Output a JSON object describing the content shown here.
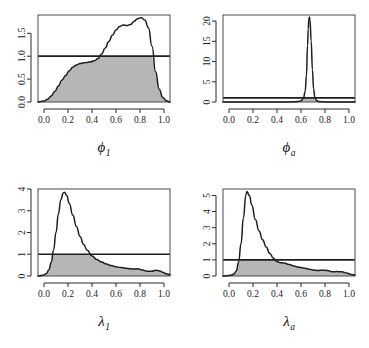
{
  "figure": {
    "title": "",
    "layout": "2x2 panel grid of kernel density plots",
    "background_color": "#ffffff",
    "curve_color": "#1d1d1d",
    "fill_color": "#b6b6b6",
    "reference_line_value": 1
  },
  "chart_data": [
    {
      "type": "line",
      "panel": "top-left",
      "title": "",
      "xlabel": "ϕ₁",
      "xlabel_base": "ϕ",
      "xlabel_sub": "1",
      "ylabel": "",
      "xlim": [
        -0.05,
        1.05
      ],
      "ylim": [
        0.0,
        1.9
      ],
      "xticks": [
        0.0,
        0.2,
        0.4,
        0.6,
        0.8,
        1.0
      ],
      "xticklabels": [
        "0.0",
        "0.2",
        "0.4",
        "0.6",
        "0.8",
        "1.0"
      ],
      "yticks": [
        0.0,
        0.5,
        1.0,
        1.5
      ],
      "yticklabels": [
        "0.0",
        "0.5",
        "1.0",
        "1.5"
      ],
      "grid": false,
      "legend": "none",
      "annotations": [
        "horizontal reference line at y = 1",
        "shaded region = min(density, 1)"
      ],
      "reference_line_y": 1.0,
      "x": [
        -0.05,
        0.0,
        0.03,
        0.06,
        0.09,
        0.12,
        0.15,
        0.18,
        0.21,
        0.24,
        0.27,
        0.3,
        0.33,
        0.36,
        0.39,
        0.42,
        0.45,
        0.48,
        0.51,
        0.54,
        0.57,
        0.6,
        0.63,
        0.66,
        0.69,
        0.72,
        0.75,
        0.78,
        0.81,
        0.84,
        0.87,
        0.9,
        0.93,
        0.96,
        0.99,
        1.02,
        1.05
      ],
      "y": [
        0.0,
        0.02,
        0.06,
        0.13,
        0.23,
        0.35,
        0.48,
        0.58,
        0.68,
        0.76,
        0.81,
        0.84,
        0.855,
        0.865,
        0.88,
        0.9,
        0.95,
        1.05,
        1.18,
        1.32,
        1.46,
        1.57,
        1.65,
        1.68,
        1.67,
        1.69,
        1.76,
        1.82,
        1.84,
        1.79,
        1.62,
        1.22,
        0.66,
        0.28,
        0.1,
        0.03,
        0.0
      ]
    },
    {
      "type": "line",
      "panel": "top-right",
      "title": "",
      "xlabel": "ϕₐ",
      "xlabel_base": "ϕ",
      "xlabel_sub": "a",
      "ylabel": "",
      "xlim": [
        -0.05,
        1.05
      ],
      "ylim": [
        0,
        21.5
      ],
      "xticks": [
        0.0,
        0.2,
        0.4,
        0.6,
        0.8,
        1.0
      ],
      "xticklabels": [
        "0.0",
        "0.2",
        "0.4",
        "0.6",
        "0.8",
        "1.0"
      ],
      "yticks": [
        0,
        5,
        10,
        15,
        20
      ],
      "yticklabels": [
        "0",
        "5",
        "10",
        "15",
        "20"
      ],
      "grid": false,
      "legend": "none",
      "annotations": [
        "horizontal reference line at y = 1",
        "sharp peak near x = 0.67 reaching 21"
      ],
      "reference_line_y": 1.0,
      "x": [
        -0.05,
        0.0,
        0.1,
        0.2,
        0.3,
        0.4,
        0.5,
        0.55,
        0.58,
        0.6,
        0.62,
        0.635,
        0.645,
        0.655,
        0.66,
        0.665,
        0.67,
        0.675,
        0.685,
        0.695,
        0.705,
        0.715,
        0.73,
        0.75,
        0.8,
        0.85,
        0.9,
        0.95,
        1.0,
        1.05
      ],
      "y": [
        0.0,
        0.0,
        0.0,
        0.0,
        0.0,
        0.0,
        0.02,
        0.06,
        0.15,
        0.3,
        0.9,
        2.6,
        6.5,
        14.0,
        18.0,
        20.4,
        21.0,
        20.2,
        15.0,
        8.0,
        3.2,
        1.2,
        0.35,
        0.1,
        0.02,
        0.0,
        0.0,
        0.0,
        0.0,
        0.0
      ]
    },
    {
      "type": "line",
      "panel": "bottom-left",
      "title": "",
      "xlabel": "λ₁",
      "xlabel_base": "λ",
      "xlabel_sub": "1",
      "ylabel": "",
      "xlim": [
        -0.05,
        1.05
      ],
      "ylim": [
        0,
        4.0
      ],
      "xticks": [
        0.0,
        0.2,
        0.4,
        0.6,
        0.8,
        1.0
      ],
      "xticklabels": [
        "0.0",
        "0.2",
        "0.4",
        "0.6",
        "0.8",
        "1.0"
      ],
      "yticks": [
        0,
        1,
        2,
        3,
        4
      ],
      "yticklabels": [
        "0",
        "1",
        "2",
        "3",
        "4"
      ],
      "grid": false,
      "legend": "none",
      "annotations": [
        "horizontal reference line at y = 1",
        "peak about 3.85 near x = 0.17"
      ],
      "reference_line_y": 1.0,
      "x": [
        -0.05,
        0.0,
        0.02,
        0.04,
        0.06,
        0.08,
        0.1,
        0.12,
        0.14,
        0.16,
        0.17,
        0.19,
        0.21,
        0.24,
        0.27,
        0.3,
        0.33,
        0.36,
        0.4,
        0.44,
        0.48,
        0.52,
        0.56,
        0.6,
        0.64,
        0.68,
        0.72,
        0.76,
        0.78,
        0.82,
        0.86,
        0.9,
        0.93,
        0.96,
        0.99,
        1.02,
        1.05
      ],
      "y": [
        0.0,
        0.05,
        0.12,
        0.28,
        0.62,
        1.2,
        2.0,
        2.85,
        3.5,
        3.82,
        3.85,
        3.7,
        3.35,
        2.8,
        2.28,
        1.82,
        1.45,
        1.18,
        0.92,
        0.76,
        0.64,
        0.55,
        0.48,
        0.43,
        0.39,
        0.36,
        0.33,
        0.32,
        0.33,
        0.28,
        0.22,
        0.22,
        0.26,
        0.24,
        0.17,
        0.1,
        0.06
      ]
    },
    {
      "type": "line",
      "panel": "bottom-right",
      "title": "",
      "xlabel": "λₐ",
      "xlabel_base": "λ",
      "xlabel_sub": "a",
      "ylabel": "",
      "xlim": [
        -0.05,
        1.05
      ],
      "ylim": [
        0,
        5.4
      ],
      "xticks": [
        0.0,
        0.2,
        0.4,
        0.6,
        0.8,
        1.0
      ],
      "xticklabels": [
        "0.0",
        "0.2",
        "0.4",
        "0.6",
        "0.8",
        "1.0"
      ],
      "yticks": [
        0,
        1,
        2,
        3,
        4,
        5
      ],
      "yticklabels": [
        "0",
        "1",
        "2",
        "3",
        "4",
        "5"
      ],
      "grid": false,
      "legend": "none",
      "annotations": [
        "horizontal reference line at y = 1",
        "peak about 5.25 near x = 0.15"
      ],
      "reference_line_y": 1.0,
      "x": [
        -0.05,
        0.0,
        0.02,
        0.04,
        0.06,
        0.08,
        0.1,
        0.12,
        0.14,
        0.15,
        0.17,
        0.19,
        0.22,
        0.25,
        0.28,
        0.31,
        0.34,
        0.37,
        0.4,
        0.43,
        0.46,
        0.5,
        0.54,
        0.58,
        0.62,
        0.66,
        0.7,
        0.74,
        0.78,
        0.82,
        0.86,
        0.9,
        0.94,
        0.98,
        1.02,
        1.05
      ],
      "y": [
        0.0,
        0.03,
        0.06,
        0.12,
        0.3,
        0.85,
        2.0,
        3.6,
        5.0,
        5.25,
        5.0,
        4.4,
        3.5,
        2.8,
        2.25,
        1.8,
        1.4,
        1.1,
        0.9,
        0.82,
        0.8,
        0.72,
        0.62,
        0.55,
        0.5,
        0.44,
        0.38,
        0.34,
        0.36,
        0.34,
        0.26,
        0.28,
        0.26,
        0.18,
        0.1,
        0.06
      ]
    }
  ]
}
